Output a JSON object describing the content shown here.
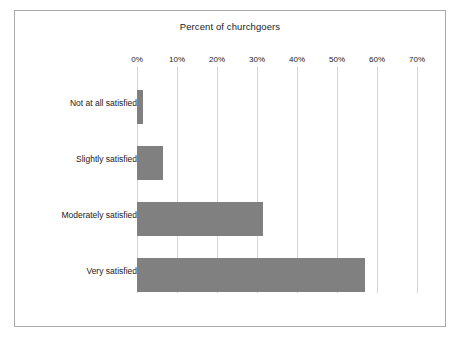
{
  "chart_data": {
    "type": "bar",
    "orientation": "horizontal",
    "title": "Percent of churchgoers",
    "xlabel": "",
    "ylabel": "",
    "categories": [
      "Not at all satisfied",
      "Slightly satisfied",
      "Moderately satisfied",
      "Very satisfied"
    ],
    "values": [
      1.5,
      6.5,
      31.5,
      57
    ],
    "xlim": [
      0,
      70
    ],
    "xticks": [
      0,
      10,
      20,
      30,
      40,
      50,
      60,
      70
    ],
    "xtick_labels": [
      "0%",
      "10%",
      "20%",
      "30%",
      "40%",
      "50%",
      "60%",
      "70%"
    ],
    "grid": "vertical",
    "legend": "none",
    "bar_color": "#808080",
    "gridline_color": "#d6d6d6",
    "border_color": "#a9a9a9",
    "background_color": "#ffffff"
  }
}
